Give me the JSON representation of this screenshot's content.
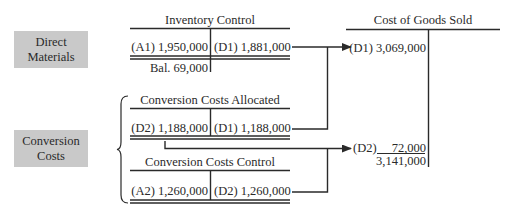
{
  "labels": {
    "direct_materials": [
      "Direct",
      "Materials"
    ],
    "conversion_costs": [
      "Conversion",
      "Costs"
    ]
  },
  "accounts": {
    "inventory_control": {
      "title": "Inventory Control",
      "debit": "(A1) 1,950,000",
      "credit": "(D1) 1,881,000",
      "balance": "Bal. 69,000"
    },
    "conversion_costs_allocated": {
      "title": "Conversion Costs Allocated",
      "debit": "(D2) 1,188,000",
      "credit": "(D1) 1,188,000"
    },
    "conversion_costs_control": {
      "title": "Conversion Costs Control",
      "debit": "(A2) 1,260,000",
      "credit": "(D2) 1,260,000"
    },
    "cost_of_goods_sold": {
      "title": "Cost of Goods Sold",
      "entry_d1": "(D1) 3,069,000",
      "entry_d2_label": "(D2)",
      "entry_d2_amount": "72,000",
      "total": "3,141,000"
    }
  },
  "colors": {
    "box_fill": "#c9c9c9",
    "line": "#2a2a2a"
  }
}
